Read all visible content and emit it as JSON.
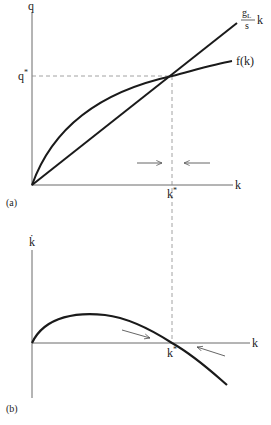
{
  "figure": {
    "panel_a": {
      "tag": "(a)",
      "y_axis_label": "q",
      "x_axis_label": "k",
      "q_star_label": "q*",
      "k_star_label": "k*",
      "curve_f_label": "f(k)",
      "line_label_num": "gL",
      "line_label_num_base": "g",
      "line_label_num_sub": "L",
      "line_label_den": "s",
      "line_label_var": "k",
      "arrows": [
        "right-arrow",
        "left-arrow"
      ]
    },
    "panel_b": {
      "tag": "(b)",
      "y_axis_label": "k̇",
      "x_axis_label": "k",
      "k_star_label": "k*",
      "arrows": [
        "down-right-arrow",
        "up-left-arrow"
      ]
    },
    "colors": {
      "curve": "#1a1a1a",
      "axis": "#6a6a6a",
      "dashed": "#8a8a8a",
      "arrow": "#555555",
      "background": "#ffffff"
    }
  }
}
